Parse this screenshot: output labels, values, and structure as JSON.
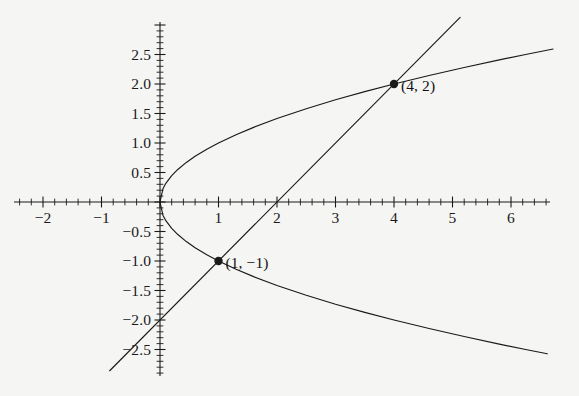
{
  "figure": {
    "background_color": "#f5f5f3",
    "ink_color": "#1a1a1a",
    "width": 579,
    "height": 396
  },
  "chart_data": {
    "type": "line",
    "title": "",
    "subtitle": "",
    "xlabel": "",
    "ylabel": "",
    "xlim": [
      -2.75,
      7.15
    ],
    "ylim": [
      -3.25,
      3.3
    ],
    "grid": false,
    "legend_position": "none",
    "axes": {
      "origin_px": [
        160,
        202
      ],
      "x_unit_px": 58.5,
      "y_unit_px": 59,
      "x_tick_labels": [
        "-2",
        "-1",
        "1",
        "2",
        "3",
        "4",
        "5",
        "6"
      ],
      "x_tick_values": [
        -2,
        -1,
        1,
        2,
        3,
        4,
        5,
        6
      ],
      "x_minor_tick_step": 0.2,
      "x_axis_range_px": [
        14,
        550
      ],
      "y_tick_labels": [
        "2.5",
        "2.0",
        "1.5",
        "1.0",
        "0.5",
        "-0.5",
        "-1.0",
        "-1.5",
        "-2.0",
        "-2.5"
      ],
      "y_tick_values": [
        2.5,
        2.0,
        1.5,
        1.0,
        0.5,
        -0.5,
        -1.0,
        -1.5,
        -2.0,
        -2.5
      ],
      "y_minor_tick_step": 0.1,
      "y_axis_range_px": [
        22,
        376
      ]
    },
    "series": [
      {
        "name": "parabola-upper",
        "equation": "y = sqrt(x)",
        "x_domain": [
          0,
          6.72
        ],
        "points": [
          [
            0,
            0
          ],
          [
            0.05,
            0.2236
          ],
          [
            0.1,
            0.3162
          ],
          [
            0.2,
            0.4472
          ],
          [
            0.3,
            0.5477
          ],
          [
            0.45,
            0.6708
          ],
          [
            0.6,
            0.7746
          ],
          [
            0.8,
            0.8944
          ],
          [
            1,
            1
          ],
          [
            1.3,
            1.1402
          ],
          [
            1.6,
            1.2649
          ],
          [
            2,
            1.4142
          ],
          [
            2.5,
            1.5811
          ],
          [
            3,
            1.7321
          ],
          [
            3.5,
            1.8708
          ],
          [
            4,
            2
          ],
          [
            4.6,
            2.1448
          ],
          [
            5.2,
            2.2804
          ],
          [
            5.8,
            2.4083
          ],
          [
            6.25,
            2.5
          ],
          [
            6.72,
            2.5923
          ]
        ]
      },
      {
        "name": "parabola-lower",
        "equation": "y = -sqrt(x)",
        "x_domain": [
          0,
          6.62
        ],
        "points": [
          [
            0,
            0
          ],
          [
            0.05,
            -0.2236
          ],
          [
            0.1,
            -0.3162
          ],
          [
            0.2,
            -0.4472
          ],
          [
            0.3,
            -0.5477
          ],
          [
            0.45,
            -0.6708
          ],
          [
            0.6,
            -0.7746
          ],
          [
            0.8,
            -0.8944
          ],
          [
            1,
            -1
          ],
          [
            1.3,
            -1.1402
          ],
          [
            1.6,
            -1.2649
          ],
          [
            2,
            -1.4142
          ],
          [
            2.5,
            -1.5811
          ],
          [
            3,
            -1.7321
          ],
          [
            3.5,
            -1.8708
          ],
          [
            4,
            -2
          ],
          [
            4.6,
            -2.1448
          ],
          [
            5.2,
            -2.2804
          ],
          [
            5.8,
            -2.4083
          ],
          [
            6.25,
            -2.5
          ],
          [
            6.62,
            -2.5729
          ]
        ]
      },
      {
        "name": "line",
        "equation": "y = x - 2",
        "x_domain": [
          -0.86,
          5.13
        ],
        "points": [
          [
            -0.86,
            -2.86
          ],
          [
            5.13,
            3.13
          ]
        ]
      }
    ],
    "annotations": [
      {
        "name": "intersection-upper",
        "label": "(4, 2)",
        "x": 4,
        "y": 2,
        "marker": "filled-circle",
        "label_offset_px": [
          7,
          2
        ]
      },
      {
        "name": "intersection-lower",
        "label": "(1, −1)",
        "x": 1,
        "y": -1,
        "marker": "filled-circle",
        "label_offset_px": [
          7,
          2
        ]
      }
    ]
  }
}
